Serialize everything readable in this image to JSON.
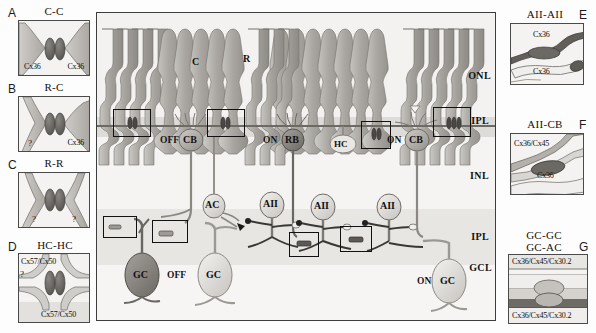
{
  "figure": {
    "panels_left": [
      {
        "letter": "A",
        "title": "C-C",
        "labels": [
          "Cx36",
          "Cx36"
        ],
        "questions": []
      },
      {
        "letter": "B",
        "title": "R-C",
        "labels": [
          "?",
          "Cx36"
        ],
        "questions": [
          "?"
        ]
      },
      {
        "letter": "C",
        "title": "R-R",
        "labels": [
          "?",
          "?"
        ],
        "questions": [
          "?",
          "?"
        ]
      },
      {
        "letter": "D",
        "title": "HC-HC",
        "labels": [
          "Cx57/Cx50",
          "Cx57/Cx50"
        ],
        "questions": [
          "?",
          "?"
        ]
      }
    ],
    "panels_right": [
      {
        "letter": "E",
        "title": "AII-AII",
        "labels": [
          "Cx36",
          "Cx36"
        ]
      },
      {
        "letter": "F",
        "title": "AII-CB",
        "labels": [
          "Cx36/Cx45",
          "Cx36"
        ]
      },
      {
        "letter": "G",
        "title_line1": "GC-GC",
        "title_line2": "GC-AC",
        "labels": [
          "Cx36/Cx45/Cx30.2",
          "Cx36/Cx45/Cx30.2"
        ]
      }
    ],
    "central": {
      "layer_labels": [
        "ONL",
        "IPL",
        "INL",
        "IPL",
        "GCL"
      ],
      "photoreceptors": {
        "cone": "C",
        "rod": "R"
      },
      "cells": [
        {
          "prefix": "OFF",
          "soma": "CB"
        },
        {
          "prefix": "ON",
          "soma": "RB"
        },
        {
          "prefix": "",
          "soma": "HC"
        },
        {
          "prefix": "ON",
          "soma": "CB"
        },
        {
          "prefix": "",
          "soma": "AC"
        },
        {
          "prefix": "",
          "soma": "AII"
        },
        {
          "prefix": "",
          "soma": "AII"
        },
        {
          "prefix": "",
          "soma": "AII"
        },
        {
          "prefix": "",
          "soma": "GC"
        },
        {
          "prefix": "OFF",
          "soma": ""
        },
        {
          "prefix": "",
          "soma": "GC"
        },
        {
          "prefix": "ON",
          "soma": "GC"
        }
      ],
      "cone_label": "C",
      "rod_label": "R",
      "off_label_1": "OFF",
      "cb_label_1": "CB",
      "on_label_1": "ON",
      "rb_label": "RB",
      "hc_label": "HC",
      "on_label_2": "ON",
      "cb_label_2": "CB",
      "ac_label": "AC",
      "aii_label_1": "AII",
      "aii_label_2": "AII",
      "aii_label_3": "AII",
      "gc_label_1": "GC",
      "off_label_2": "OFF",
      "gc_label_2": "GC",
      "on_label_3": "ON",
      "gc_label_3": "GC",
      "label_ONL": "ONL",
      "label_OPL": "IPL",
      "label_INL": "INL",
      "label_IPL": "IPL",
      "label_GCL": "GCL"
    },
    "colors": {
      "panel_border": "#4a4a4a",
      "panel_bg": "#f2f1ef",
      "central_bg": "#ececea",
      "cell_light": "#d9d7d3",
      "cell_mid": "#a9a6a1",
      "cell_dark": "#6a6762",
      "plaque_dark": "#5c5a57",
      "ink": "#111111"
    }
  }
}
